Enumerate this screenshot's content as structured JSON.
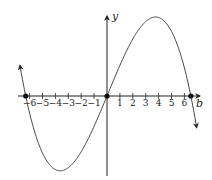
{
  "chart_data": {
    "type": "line",
    "title": "",
    "xlabel": "b",
    "ylabel": "y",
    "x_ticks": [
      -6,
      -5,
      -4,
      -3,
      -2,
      -1,
      1,
      2,
      3,
      4,
      5,
      6
    ],
    "x_tick_labels": [
      "−6",
      "−5",
      "−4",
      "−3",
      "−2",
      "−1",
      "1",
      "2",
      "3",
      "4",
      "5",
      "6"
    ],
    "xlim": [
      -6.9,
      7.2
    ],
    "grid": false,
    "legend": null,
    "series": [
      {
        "name": "cubic curve",
        "description": "Cubic opening downward on the right: rises from left, dips to a local minimum near x≈-3.5, crosses origin, peaks near x≈3.9, falls past x≈6.5",
        "roots": [
          -6.3,
          0,
          6.5
        ],
        "marked_points": [
          [
            -6.3,
            0
          ],
          [
            0,
            0
          ],
          [
            6.5,
            0
          ]
        ],
        "local_min_x": -3.5,
        "local_max_x": 3.9,
        "arrow_ends": true
      }
    ]
  },
  "labels": {
    "y_axis": "y",
    "x_axis": "b"
  }
}
